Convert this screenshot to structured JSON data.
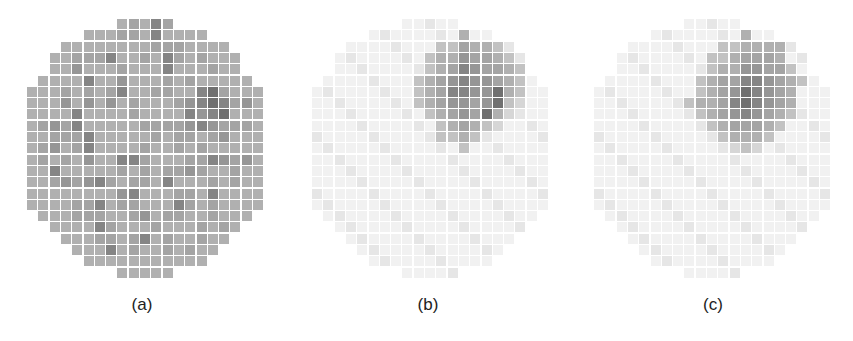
{
  "figure": {
    "pitch": 11.3,
    "cell_size": 10,
    "rows": 23,
    "cols": 21,
    "palette": [
      "#f1f1f1",
      "#e6e6e6",
      "#d6d6d6",
      "#c2c2c2",
      "#b0b0b0",
      "#a4a4a4",
      "#969696",
      "#858585",
      "#707070",
      "#5a5a5a"
    ],
    "panels": [
      {
        "id": "a",
        "label": "(a)",
        "left": 27,
        "label_center": 142,
        "grid": [
          "........45475........",
          ".....44455474444.....",
          "...444444445554444...",
          "..4455574454754544...",
          "..4464445444744454...",
          ".44447446444545444...",
          "444545457445544785444",
          "444646464544456787564",
          "444474444544447678444",
          "456574444455556765554",
          "445557444445455456444",
          "456457444454454544444",
          "454546447754445576564",
          "447444445454556544544",
          "445656754554744454544",
          ".44444446744455474.44",
          "..4455745544475454..",
          "...455544564554454...",
          "....44754445444545...",
          "....445545745445...",
          ".....4474544545......",
          "........44444........",
          "....................."
        ]
      },
      {
        "id": "b",
        "label": "(b)",
        "left": 312,
        "label_center": 428,
        "hotspot": [
          {
            "row": 1,
            "cells": {
              "13": 4
            }
          },
          {
            "row": 2,
            "cells": {
              "11": 3,
              "12": 3,
              "13": 5,
              "14": 4,
              "15": 4,
              "16": 3
            }
          },
          {
            "row": 3,
            "cells": {
              "10": 3,
              "11": 4,
              "12": 4,
              "13": 6,
              "14": 5,
              "15": 5,
              "16": 4,
              "17": 3
            }
          },
          {
            "row": 4,
            "cells": {
              "10": 3,
              "11": 4,
              "12": 5,
              "13": 7,
              "14": 6,
              "15": 5,
              "16": 5,
              "17": 4,
              "18": 3
            }
          },
          {
            "row": 5,
            "cells": {
              "9": 3,
              "10": 4,
              "11": 5,
              "12": 6,
              "13": 7,
              "14": 6,
              "15": 6,
              "16": 5,
              "17": 4,
              "18": 3
            }
          },
          {
            "row": 6,
            "cells": {
              "9": 3,
              "10": 4,
              "11": 5,
              "12": 7,
              "13": 7,
              "14": 6,
              "15": 6,
              "16": 8,
              "17": 4,
              "18": 3
            }
          },
          {
            "row": 7,
            "cells": {
              "9": 3,
              "10": 4,
              "11": 5,
              "12": 6,
              "13": 6,
              "14": 5,
              "15": 6,
              "16": 8,
              "17": 3,
              "18": 2
            }
          },
          {
            "row": 8,
            "cells": {
              "10": 3,
              "11": 4,
              "12": 5,
              "13": 6,
              "14": 5,
              "15": 8,
              "16": 4,
              "17": 2
            }
          },
          {
            "row": 9,
            "cells": {
              "11": 3,
              "12": 4,
              "13": 5,
              "14": 4,
              "15": 3,
              "16": 2
            }
          },
          {
            "row": 10,
            "cells": {
              "11": 3,
              "12": 3,
              "13": 4,
              "14": 3
            }
          },
          {
            "row": 11,
            "cells": {
              "13": 3
            }
          }
        ]
      },
      {
        "id": "c",
        "label": "(c)",
        "left": 594,
        "label_center": 713,
        "hotspot": [
          {
            "row": 1,
            "cells": {
              "13": 4
            }
          },
          {
            "row": 2,
            "cells": {
              "11": 3,
              "12": 3,
              "13": 4,
              "14": 4,
              "15": 4,
              "16": 4
            }
          },
          {
            "row": 3,
            "cells": {
              "10": 3,
              "11": 3,
              "12": 4,
              "13": 5,
              "14": 5,
              "15": 5,
              "16": 4
            }
          },
          {
            "row": 4,
            "cells": {
              "10": 3,
              "11": 4,
              "12": 4,
              "13": 6,
              "14": 6,
              "15": 5,
              "16": 5,
              "17": 3
            }
          },
          {
            "row": 5,
            "cells": {
              "9": 3,
              "10": 4,
              "11": 5,
              "12": 5,
              "13": 7,
              "14": 7,
              "15": 6,
              "16": 5,
              "17": 4,
              "18": 3
            }
          },
          {
            "row": 6,
            "cells": {
              "9": 3,
              "10": 4,
              "11": 5,
              "12": 6,
              "13": 8,
              "14": 7,
              "15": 6,
              "16": 5,
              "17": 4
            }
          },
          {
            "row": 7,
            "cells": {
              "8": 3,
              "9": 4,
              "10": 4,
              "11": 5,
              "12": 7,
              "13": 8,
              "14": 7,
              "15": 6,
              "16": 5,
              "17": 4
            }
          },
          {
            "row": 8,
            "cells": {
              "9": 3,
              "10": 4,
              "11": 5,
              "12": 6,
              "13": 7,
              "14": 6,
              "15": 5,
              "16": 4,
              "17": 3
            }
          },
          {
            "row": 9,
            "cells": {
              "10": 3,
              "11": 4,
              "12": 5,
              "13": 5,
              "14": 5,
              "15": 4,
              "16": 3
            }
          },
          {
            "row": 10,
            "cells": {
              "11": 3,
              "12": 4,
              "13": 4,
              "14": 4,
              "15": 3
            }
          },
          {
            "row": 11,
            "cells": {
              "12": 2,
              "13": 3,
              "14": 2
            }
          }
        ]
      }
    ],
    "row_spans": [
      [
        8,
        12
      ],
      [
        5,
        15
      ],
      [
        3,
        17
      ],
      [
        2,
        18
      ],
      [
        2,
        18
      ],
      [
        1,
        19
      ],
      [
        0,
        20
      ],
      [
        0,
        20
      ],
      [
        0,
        20
      ],
      [
        0,
        20
      ],
      [
        0,
        20
      ],
      [
        0,
        20
      ],
      [
        0,
        20
      ],
      [
        0,
        20
      ],
      [
        0,
        20
      ],
      [
        0,
        20
      ],
      [
        0,
        20
      ],
      [
        1,
        19
      ],
      [
        2,
        18
      ],
      [
        3,
        17
      ],
      [
        4,
        16
      ],
      [
        5,
        15
      ],
      [
        8,
        12
      ]
    ]
  }
}
